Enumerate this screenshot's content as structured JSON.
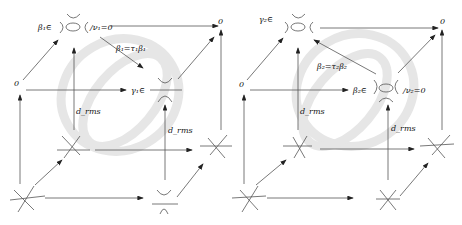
{
  "figure": {
    "panels": [
      {
        "id": "left",
        "labels": {
          "top_left": "β₁∈",
          "top_left_cond": "/ν₁=0",
          "top_right": "0",
          "mid_left": "0",
          "diagonal": "β₁=τ₁β₁",
          "mid_right": "γ₁∈",
          "vertical_back": "d_rms",
          "vertical_front": "d_rms"
        }
      },
      {
        "id": "right",
        "labels": {
          "top_left": "γ₂∈",
          "top_right": "0",
          "mid_left": "0",
          "diagonal": "β₂=τ₂β₂",
          "mid_right": "β₂∈",
          "mid_right_cond": "/ν₂=0",
          "vertical_back": "d_rms",
          "vertical_front": "d_rms"
        }
      }
    ]
  }
}
